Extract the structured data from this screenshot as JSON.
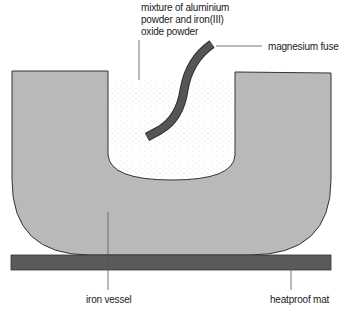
{
  "diagram": {
    "labels": {
      "mixture_line1": "mixture of aluminium",
      "mixture_line2": "powder and iron(III)",
      "mixture_line3": "oxide powder",
      "fuse": "magnesium fuse",
      "vessel": "iron vessel",
      "mat": "heatproof mat"
    },
    "colors": {
      "vessel_fill": "#b9b9b9",
      "vessel_stroke": "#333333",
      "mat_fill": "#5a5a5a",
      "fuse_fill": "#555555",
      "powder_dots": "#cfcfcf",
      "leader_line": "#555555"
    }
  }
}
